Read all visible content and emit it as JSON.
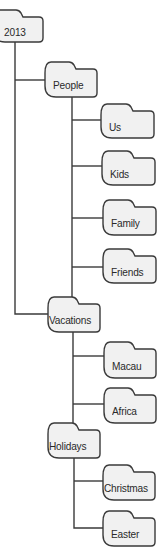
{
  "diagram": {
    "type": "folder-tree",
    "colors": {
      "folder_fill": "#f1f1f1",
      "stroke": "#3a3a3a",
      "text": "#2a2a2a",
      "background": "#ffffff"
    },
    "folders": [
      {
        "id": "2013",
        "label": "2013",
        "parent": null,
        "x": -6,
        "y": 10,
        "w": 49,
        "h": 32
      },
      {
        "id": "people",
        "label": "People",
        "parent": "2013",
        "x": 45,
        "y": 62,
        "w": 52,
        "h": 35
      },
      {
        "id": "us",
        "label": "Us",
        "parent": "people",
        "x": 101,
        "y": 104,
        "w": 53,
        "h": 34
      },
      {
        "id": "kids",
        "label": "Kids",
        "parent": "people",
        "x": 102,
        "y": 151,
        "w": 53,
        "h": 34
      },
      {
        "id": "family",
        "label": "Family",
        "parent": "people",
        "x": 103,
        "y": 200,
        "w": 53,
        "h": 35
      },
      {
        "id": "friends",
        "label": "Friends",
        "parent": "people",
        "x": 103,
        "y": 249,
        "w": 53,
        "h": 34
      },
      {
        "id": "vacations",
        "label": "Vacations",
        "parent": "2013",
        "x": 48,
        "y": 297,
        "w": 52,
        "h": 35
      },
      {
        "id": "macau",
        "label": "Macau",
        "parent": "vacations",
        "x": 104,
        "y": 342,
        "w": 52,
        "h": 36
      },
      {
        "id": "africa",
        "label": "Africa",
        "parent": "vacations",
        "x": 104,
        "y": 388,
        "w": 52,
        "h": 35
      },
      {
        "id": "holidays",
        "label": "Holidays",
        "parent": "vacations",
        "x": 48,
        "y": 423,
        "w": 52,
        "h": 35
      },
      {
        "id": "christmas",
        "label": "Christmas",
        "parent": "holidays",
        "x": 103,
        "y": 465,
        "w": 52,
        "h": 35
      },
      {
        "id": "easter",
        "label": "Easter",
        "parent": "holidays",
        "x": 103,
        "y": 511,
        "w": 52,
        "h": 35
      }
    ],
    "connectors": [
      {
        "from": "2013",
        "path": "M15 42 V314 H48"
      },
      {
        "from": "2013-people",
        "path": "M15 80 H45"
      },
      {
        "from": "people",
        "path": "M72 97 V297"
      },
      {
        "from": "people-us",
        "path": "M72 120 H101"
      },
      {
        "from": "people-kids",
        "path": "M72 166 H102"
      },
      {
        "from": "people-family",
        "path": "M72 218 H103"
      },
      {
        "from": "people-friends",
        "path": "M72 267 H103"
      },
      {
        "from": "vacations",
        "path": "M73 332 V423"
      },
      {
        "from": "vacations-macau",
        "path": "M73 356 H104"
      },
      {
        "from": "vacations-africa",
        "path": "M73 404 H104"
      },
      {
        "from": "holidays",
        "path": "M74 458 V528 H103"
      },
      {
        "from": "holidays-christmas",
        "path": "M74 481 H103"
      }
    ]
  }
}
